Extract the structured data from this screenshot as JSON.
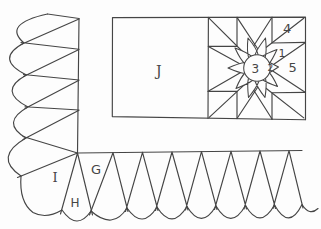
{
  "diagram": {
    "type": "hand-drawn quilt block and scalloped border pattern sketch",
    "labels": {
      "j": "J",
      "n1": "1",
      "n2": "2",
      "n3": "3",
      "n4": "4",
      "n5": "5",
      "i": "I",
      "g": "G",
      "h": "H"
    },
    "colors": {
      "ink": "#454545",
      "paper": "#fdfdfd"
    }
  }
}
